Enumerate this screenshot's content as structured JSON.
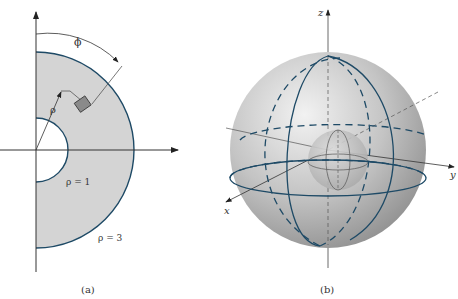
{
  "panels": [
    {
      "id": "a",
      "caption": "(a)",
      "labels": {
        "phi": "ϕ",
        "rho": "ρ",
        "inner": "ρ = 1",
        "outer": "ρ = 3"
      }
    },
    {
      "id": "b",
      "caption": "(b)",
      "labels": {
        "z": "z",
        "y": "y",
        "x": "x"
      }
    }
  ],
  "colors": {
    "region_fill": "#d4d4d4",
    "boundary": "#1e4a66",
    "axis": "#333333",
    "element": "#8a8a8a"
  }
}
